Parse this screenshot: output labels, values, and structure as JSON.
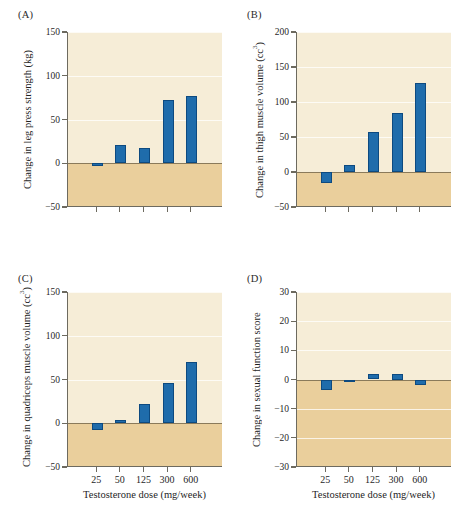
{
  "figure": {
    "background_color": "#ffffff",
    "bar_color": "#1f6cab",
    "bar_edge_color": "#0d4a80",
    "plot_positive_bg": "#f6edd7",
    "plot_negative_bg": "#eacf9c",
    "axis_color": "#6d6a5f",
    "x_axis_title": "Testosterone dose (mg/week)",
    "categories": [
      "25",
      "50",
      "125",
      "300",
      "600"
    ]
  },
  "chart_data": [
    {
      "panel": "(A)",
      "type": "bar",
      "title": "",
      "xlabel": "Testosterone dose (mg/week)",
      "ylabel": "Change in leg press strength (kg)",
      "ylabel_unit": "kg",
      "categories": [
        "25",
        "50",
        "125",
        "300",
        "600"
      ],
      "values": [
        -3,
        21,
        18,
        72,
        77
      ],
      "ylim": [
        -50,
        150
      ],
      "yticks": [
        -50,
        0,
        50,
        100,
        150
      ],
      "ytick_labels": [
        "−50",
        "0",
        "50",
        "100",
        "150"
      ],
      "grid": true,
      "legend": "none"
    },
    {
      "panel": "(B)",
      "type": "bar",
      "title": "",
      "xlabel": "Testosterone dose (mg/week)",
      "ylabel": "Change in thigh muscle volume (cc³)",
      "ylabel_unit": "cc3",
      "categories": [
        "25",
        "50",
        "125",
        "300",
        "600"
      ],
      "values": [
        -15,
        10,
        57,
        85,
        127
      ],
      "ylim": [
        -50,
        200
      ],
      "yticks": [
        -50,
        0,
        50,
        100,
        150,
        200
      ],
      "ytick_labels": [
        "−50",
        "0",
        "50",
        "100",
        "150",
        "200"
      ],
      "grid": true,
      "legend": "none"
    },
    {
      "panel": "(C)",
      "type": "bar",
      "title": "",
      "xlabel": "Testosterone dose (mg/week)",
      "ylabel": "Change in quadriceps muscle volume (cc³)",
      "ylabel_unit": "cc3",
      "categories": [
        "25",
        "50",
        "125",
        "300",
        "600"
      ],
      "values": [
        -8,
        4,
        22,
        46,
        70
      ],
      "ylim": [
        -50,
        150
      ],
      "yticks": [
        -50,
        0,
        50,
        100,
        150
      ],
      "ytick_labels": [
        "−50",
        "0",
        "50",
        "100",
        "150"
      ],
      "grid": true,
      "legend": "none"
    },
    {
      "panel": "(D)",
      "type": "bar",
      "title": "",
      "xlabel": "Testosterone dose (mg/week)",
      "ylabel": "Change in sexual function score",
      "ylabel_unit": "",
      "categories": [
        "25",
        "50",
        "125",
        "300",
        "600"
      ],
      "values": [
        -3.5,
        -0.5,
        2,
        1.8,
        -2
      ],
      "ylim": [
        -30,
        30
      ],
      "yticks": [
        -30,
        -20,
        -10,
        0,
        10,
        20,
        30
      ],
      "ytick_labels": [
        "−30",
        "−20",
        "−10",
        "0",
        "10",
        "20",
        "30"
      ],
      "grid": true,
      "legend": "none"
    }
  ],
  "panels": {
    "A": {
      "tag": "(A)",
      "ylabel_text": "Change in leg press strength (kg)"
    },
    "B": {
      "tag": "(B)",
      "ylabel_pre": "Change in thigh muscle volume (cc",
      "ylabel_sup": "3",
      "ylabel_post": ")"
    },
    "C": {
      "tag": "(C)",
      "ylabel_pre": "Change in quadriceps muscle volume (cc",
      "ylabel_sup": "3",
      "ylabel_post": ")"
    },
    "D": {
      "tag": "(D)",
      "ylabel_text": "Change in sexual function score"
    }
  }
}
